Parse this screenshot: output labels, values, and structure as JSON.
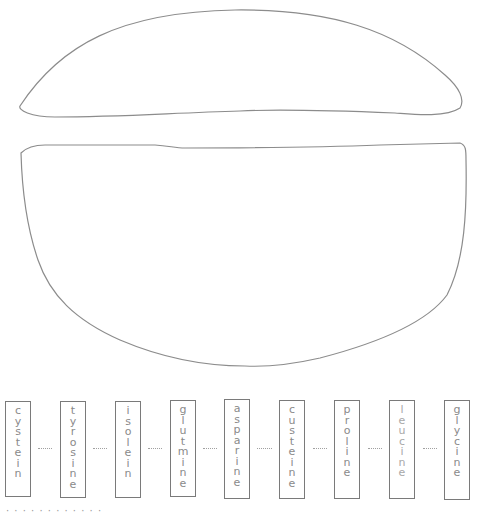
{
  "diagram": {
    "type": "hand-drawn amino acid chain diagram",
    "shapes": [
      {
        "name": "upper-lens-shape",
        "stroke": "#8c8c8c"
      },
      {
        "name": "lower-bowl-shape",
        "stroke": "#8c8c8c"
      }
    ],
    "chain": {
      "bond_symbol": "···",
      "residues": [
        {
          "label": "cysteine",
          "glyphs": [
            "c",
            "y",
            "s",
            "t",
            "e",
            "i",
            "n"
          ]
        },
        {
          "label": "tyrosine",
          "glyphs": [
            "t",
            "y",
            "r",
            "o",
            "s",
            "i",
            "n",
            "e"
          ]
        },
        {
          "label": "isoleucine",
          "glyphs": [
            "i",
            "s",
            "o",
            "l",
            "e",
            "i",
            "n"
          ]
        },
        {
          "label": "glutamine",
          "glyphs": [
            "g",
            "l",
            "u",
            "t",
            "m",
            "i",
            "n",
            "e"
          ]
        },
        {
          "label": "asparagine",
          "glyphs": [
            "a",
            "s",
            "p",
            "a",
            "r",
            "i",
            "n",
            "e"
          ]
        },
        {
          "label": "cysteine",
          "glyphs": [
            "c",
            "u",
            "s",
            "t",
            "e",
            "i",
            "n",
            "e"
          ]
        },
        {
          "label": "proline",
          "glyphs": [
            "p",
            "r",
            "o",
            "l",
            "i",
            "n",
            "e"
          ]
        },
        {
          "label": "leucine",
          "glyphs": [
            "l",
            "e",
            "u",
            "c",
            "i",
            "n",
            "e"
          ]
        },
        {
          "label": "glycine",
          "glyphs": [
            "g",
            "l",
            "y",
            "c",
            "i",
            "n",
            "e"
          ]
        }
      ]
    },
    "colors": {
      "outline": "#8c8c8c",
      "box_border": "#7a7a7a",
      "handwriting": "#8a8a8a",
      "background": "#ffffff"
    }
  },
  "footer": {
    "text": "· ·  ·   · · ·  ·  ·   ·   ·     ·    ·"
  }
}
